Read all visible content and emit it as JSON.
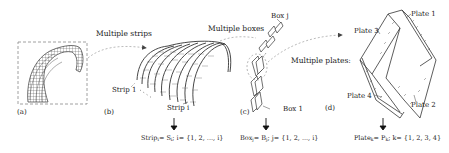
{
  "panels": {
    "a": {
      "label": "(a)"
    },
    "b": {
      "label": "(b)",
      "strip_first": "Strip 1",
      "strip_last": "Strip i"
    },
    "c": {
      "label": "(c)",
      "box_last": "Box j",
      "box_first": "Box 1"
    },
    "d": {
      "label": "(d)",
      "plates": [
        "Plate 1",
        "Plate 2",
        "Plate 3",
        "Plate 4"
      ]
    }
  },
  "transitions": {
    "a_to_b": "Multiple strips",
    "b_to_c": "Multiple boxes",
    "c_to_d": "Multiple plates:"
  },
  "formulas": {
    "strip": {
      "lhs": "Strip",
      "lhs_sub": "i",
      "eq": "= S",
      "rhs_sub": "i",
      "set": "; i= {1, 2, ..., i}"
    },
    "box": {
      "lhs": "Box",
      "lhs_sub": "j",
      "eq": "= B",
      "rhs_sub": "j",
      "set": "; j= {1, 2, ..., i}"
    },
    "plate": {
      "lhs": "Plate",
      "lhs_sub": "k",
      "eq": "= P",
      "rhs_sub": "k",
      "set": "; k= {1, 2, 3, 4}"
    }
  },
  "colors": {
    "line": "#333333",
    "dash": "#999999",
    "background": "#ffffff"
  }
}
